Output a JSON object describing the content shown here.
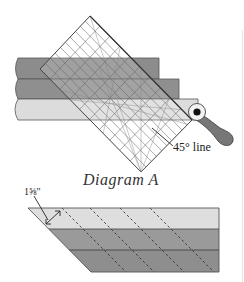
{
  "diagram_a": {
    "caption": "Diagram A",
    "angle_label": "45° line",
    "strips": [
      {
        "name": "top-strip",
        "color": "#8c8c8c"
      },
      {
        "name": "middle-strip",
        "color": "#8f8f8f"
      },
      {
        "name": "bottom-strip",
        "color": "#dcdcdc"
      }
    ],
    "ruler": {
      "shape": "square-ruler-rotated-45",
      "grid_color": "#555555"
    },
    "tool": {
      "icon": "rotary-cutter-icon",
      "handle_color": "#777777"
    }
  },
  "diagram_b": {
    "measurement_label": "1⅝\"",
    "bands": [
      {
        "name": "light-band",
        "color": "#dedede"
      },
      {
        "name": "medium-band",
        "color": "#9a9a9a"
      },
      {
        "name": "dark-band",
        "color": "#8e8e8e"
      }
    ],
    "cut_lines": "dashed diagonal lines at 45°"
  },
  "colors": {
    "outline": "#444444",
    "text": "#222222"
  }
}
